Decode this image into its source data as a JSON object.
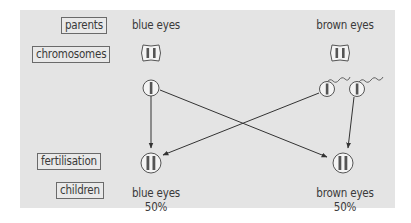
{
  "row_labels": {
    "parents": "parents",
    "chromosomes": "chromosomes",
    "fertilisation": "fertilisation",
    "children": "children"
  },
  "parents": {
    "left": "blue eyes",
    "right": "brown eyes"
  },
  "children": {
    "left": {
      "trait": "blue eyes",
      "percent": "50%"
    },
    "right": {
      "trait": "brown eyes",
      "percent": "50%"
    }
  },
  "colors": {
    "panel": "#e4e4e4",
    "line": "#333333",
    "label_border": "#6a6a6a"
  }
}
